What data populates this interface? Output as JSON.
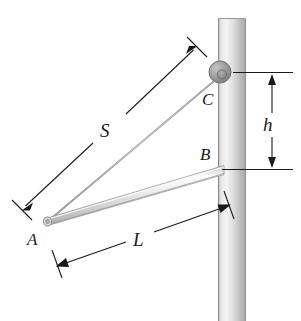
{
  "figure": {
    "type": "engineering-statics-diagram",
    "background_color": "#ffffff",
    "ink_color": "#1a1a1a",
    "labels": {
      "point_a": "A",
      "point_b": "B",
      "point_c": "C",
      "cable_length": "S",
      "bar_length": "L",
      "height": "h"
    },
    "pole": {
      "name": "vertical-pole",
      "fill_light": "#f2f2f2",
      "fill_mid": "#d0d0d0",
      "fill_dark": "#a8a8a8",
      "edge_color": "#8c8c8c",
      "x_left": 218,
      "x_right": 246,
      "y_top": 18,
      "y_bottom": 321
    },
    "bar": {
      "name": "rigid-bar-ab",
      "fill_light": "#fbfbfb",
      "fill_mid": "#dcdcdc",
      "fill_dark": "#b4b4b4",
      "edge_color": "#9a9a9a",
      "from": [
        47,
        222
      ],
      "to": [
        222,
        170
      ]
    },
    "cable": {
      "name": "cable-ac",
      "color": "#8f8f8f",
      "from": [
        47,
        222
      ],
      "to": [
        217,
        74
      ]
    },
    "collar": {
      "name": "collar-at-c",
      "fill": "#9c9c9c",
      "edge": "#6e6e6e",
      "inner_fill": "#8a8a8a",
      "center": [
        220,
        72
      ],
      "radius": 11
    },
    "dimensions": [
      {
        "name": "dimension-s",
        "label": "S",
        "from": [
          23,
          208
        ],
        "to": [
          196,
          47
        ],
        "label_pos": [
          108,
          130
        ],
        "arrow_both_ends": true
      },
      {
        "name": "dimension-l",
        "label": "L",
        "from": [
          57,
          266
        ],
        "to": [
          229,
          205
        ],
        "label_pos": [
          140,
          241
        ],
        "arrow_both_ends": true
      },
      {
        "name": "dimension-h",
        "label": "h",
        "from": [
          272,
          73
        ],
        "to": [
          272,
          170
        ],
        "label_pos": [
          270,
          128
        ],
        "arrow_both_ends": true,
        "extension_lines": [
          {
            "y": 73,
            "x1": 233,
            "x2": 293
          },
          {
            "y": 170,
            "x1": 222,
            "x2": 293
          }
        ]
      }
    ]
  }
}
